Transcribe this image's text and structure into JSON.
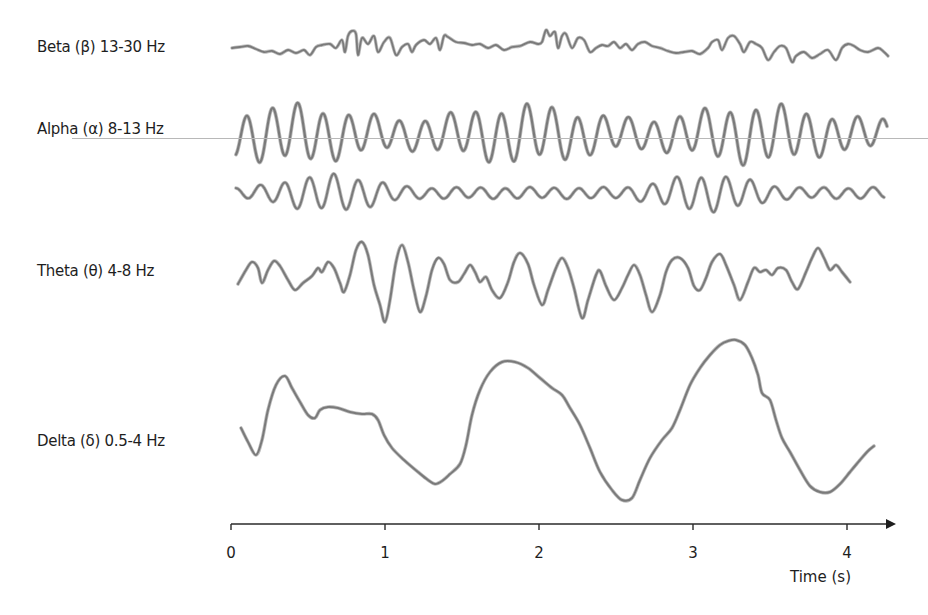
{
  "chart_data": {
    "type": "line",
    "title": "",
    "xlabel": "Time (s)",
    "ylabel": "",
    "xlim": [
      0,
      4.3
    ],
    "x_ticks": [
      "0",
      "1",
      "2",
      "3",
      "4"
    ],
    "grid": false,
    "legend": "none (row labels on left)",
    "stroke_color": "#7a7a7a",
    "series": [
      {
        "name": "Beta (β) 13-30 Hz",
        "band": "beta",
        "freq_range_hz": [
          13,
          30
        ],
        "baseline_y": 50,
        "amplitude_px": 12
      },
      {
        "name": "Alpha (α) 8-13 Hz",
        "band": "alpha",
        "freq_range_hz": [
          8,
          13
        ],
        "baseline_y": 135,
        "amplitude_px": 28
      },
      {
        "name": "Alpha (α) 8-13 Hz (second trace)",
        "band": "alpha-2",
        "freq_range_hz": [
          8,
          13
        ],
        "baseline_y": 193,
        "amplitude_px": 14
      },
      {
        "name": "Theta (θ) 4-8 Hz",
        "band": "theta",
        "freq_range_hz": [
          4,
          8
        ],
        "baseline_y": 275,
        "amplitude_px": 40
      },
      {
        "name": "Delta (δ) 0.5-4 Hz",
        "band": "delta",
        "freq_range_hz": [
          0.5,
          4
        ],
        "baseline_y": 420,
        "amplitude_px": 80
      }
    ]
  },
  "labels": {
    "beta": "Beta (β) 13-30 Hz",
    "alpha": "Alpha (α) 8-13 Hz",
    "theta": "Theta (θ) 4-8 Hz",
    "delta": "Delta (δ) 0.5-4 Hz"
  },
  "axis": {
    "title": "Time (s)",
    "ticks": [
      "0",
      "1",
      "2",
      "3",
      "4"
    ]
  },
  "waves": {
    "delta": [
      [
        241,
        428
      ],
      [
        248,
        442
      ],
      [
        256,
        455
      ],
      [
        262,
        440
      ],
      [
        268,
        410
      ],
      [
        276,
        385
      ],
      [
        285,
        376
      ],
      [
        292,
        388
      ],
      [
        300,
        402
      ],
      [
        308,
        415
      ],
      [
        315,
        418
      ],
      [
        320,
        410
      ],
      [
        328,
        407
      ],
      [
        338,
        408
      ],
      [
        350,
        412
      ],
      [
        362,
        414
      ],
      [
        372,
        414
      ],
      [
        378,
        420
      ],
      [
        384,
        435
      ],
      [
        392,
        448
      ],
      [
        404,
        460
      ],
      [
        418,
        472
      ],
      [
        428,
        480
      ],
      [
        435,
        484
      ],
      [
        442,
        481
      ],
      [
        450,
        474
      ],
      [
        460,
        464
      ],
      [
        466,
        445
      ],
      [
        472,
        415
      ],
      [
        480,
        390
      ],
      [
        490,
        372
      ],
      [
        502,
        362
      ],
      [
        515,
        362
      ],
      [
        528,
        368
      ],
      [
        540,
        378
      ],
      [
        552,
        388
      ],
      [
        562,
        395
      ],
      [
        570,
        408
      ],
      [
        580,
        425
      ],
      [
        590,
        448
      ],
      [
        600,
        472
      ],
      [
        612,
        490
      ],
      [
        622,
        500
      ],
      [
        632,
        498
      ],
      [
        640,
        480
      ],
      [
        650,
        458
      ],
      [
        662,
        440
      ],
      [
        672,
        428
      ],
      [
        680,
        410
      ],
      [
        690,
        385
      ],
      [
        700,
        368
      ],
      [
        710,
        355
      ],
      [
        720,
        345
      ],
      [
        728,
        341
      ],
      [
        736,
        340
      ],
      [
        745,
        345
      ],
      [
        752,
        358
      ],
      [
        758,
        375
      ],
      [
        762,
        393
      ],
      [
        770,
        400
      ],
      [
        776,
        420
      ],
      [
        782,
        438
      ],
      [
        790,
        452
      ],
      [
        800,
        470
      ],
      [
        810,
        486
      ],
      [
        820,
        492
      ],
      [
        830,
        492
      ],
      [
        840,
        484
      ],
      [
        850,
        472
      ],
      [
        860,
        460
      ],
      [
        868,
        451
      ],
      [
        874,
        446
      ]
    ],
    "theta": [
      [
        238,
        284
      ],
      [
        246,
        270
      ],
      [
        252,
        262
      ],
      [
        258,
        268
      ],
      [
        262,
        283
      ],
      [
        268,
        270
      ],
      [
        274,
        261
      ],
      [
        280,
        266
      ],
      [
        288,
        280
      ],
      [
        295,
        290
      ],
      [
        303,
        283
      ],
      [
        312,
        276
      ],
      [
        318,
        268
      ],
      [
        322,
        272
      ],
      [
        328,
        262
      ],
      [
        334,
        268
      ],
      [
        340,
        283
      ],
      [
        344,
        292
      ],
      [
        350,
        275
      ],
      [
        356,
        250
      ],
      [
        362,
        242
      ],
      [
        368,
        255
      ],
      [
        374,
        285
      ],
      [
        380,
        305
      ],
      [
        385,
        322
      ],
      [
        390,
        300
      ],
      [
        396,
        262
      ],
      [
        402,
        245
      ],
      [
        408,
        262
      ],
      [
        414,
        290
      ],
      [
        420,
        312
      ],
      [
        426,
        296
      ],
      [
        432,
        270
      ],
      [
        438,
        258
      ],
      [
        444,
        264
      ],
      [
        450,
        280
      ],
      [
        458,
        282
      ],
      [
        464,
        274
      ],
      [
        470,
        265
      ],
      [
        475,
        272
      ],
      [
        480,
        282
      ],
      [
        486,
        277
      ],
      [
        492,
        290
      ],
      [
        500,
        298
      ],
      [
        508,
        282
      ],
      [
        514,
        262
      ],
      [
        520,
        253
      ],
      [
        528,
        264
      ],
      [
        534,
        285
      ],
      [
        542,
        305
      ],
      [
        548,
        290
      ],
      [
        556,
        268
      ],
      [
        562,
        258
      ],
      [
        568,
        268
      ],
      [
        574,
        288
      ],
      [
        582,
        318
      ],
      [
        588,
        300
      ],
      [
        596,
        275
      ],
      [
        600,
        271
      ],
      [
        606,
        286
      ],
      [
        614,
        300
      ],
      [
        622,
        288
      ],
      [
        628,
        275
      ],
      [
        634,
        265
      ],
      [
        640,
        275
      ],
      [
        646,
        295
      ],
      [
        652,
        312
      ],
      [
        660,
        295
      ],
      [
        666,
        272
      ],
      [
        672,
        260
      ],
      [
        680,
        258
      ],
      [
        688,
        268
      ],
      [
        694,
        286
      ],
      [
        700,
        290
      ],
      [
        706,
        278
      ],
      [
        712,
        262
      ],
      [
        720,
        254
      ],
      [
        726,
        265
      ],
      [
        734,
        285
      ],
      [
        740,
        300
      ],
      [
        748,
        282
      ],
      [
        754,
        268
      ],
      [
        760,
        272
      ],
      [
        766,
        270
      ],
      [
        772,
        275
      ],
      [
        778,
        268
      ],
      [
        786,
        270
      ],
      [
        792,
        282
      ],
      [
        798,
        289
      ],
      [
        806,
        272
      ],
      [
        812,
        258
      ],
      [
        818,
        248
      ],
      [
        824,
        258
      ],
      [
        830,
        270
      ],
      [
        836,
        265
      ],
      [
        842,
        272
      ],
      [
        850,
        282
      ]
    ],
    "beta": [
      [
        232,
        48
      ],
      [
        240,
        47
      ],
      [
        248,
        46
      ],
      [
        256,
        49
      ],
      [
        264,
        52
      ],
      [
        272,
        51
      ],
      [
        280,
        54
      ],
      [
        288,
        50
      ],
      [
        296,
        53
      ],
      [
        304,
        50
      ],
      [
        310,
        55
      ],
      [
        316,
        47
      ],
      [
        322,
        45
      ],
      [
        330,
        44
      ],
      [
        336,
        48
      ],
      [
        342,
        40
      ],
      [
        345,
        52
      ],
      [
        348,
        36
      ],
      [
        352,
        31
      ],
      [
        356,
        34
      ],
      [
        358,
        55
      ],
      [
        362,
        38
      ],
      [
        368,
        44
      ],
      [
        374,
        36
      ],
      [
        378,
        52
      ],
      [
        384,
        42
      ],
      [
        390,
        38
      ],
      [
        396,
        55
      ],
      [
        402,
        47
      ],
      [
        408,
        44
      ],
      [
        412,
        52
      ],
      [
        416,
        45
      ],
      [
        424,
        40
      ],
      [
        430,
        44
      ],
      [
        436,
        38
      ],
      [
        440,
        50
      ],
      [
        444,
        36
      ],
      [
        448,
        37
      ],
      [
        456,
        42
      ],
      [
        464,
        43
      ],
      [
        472,
        45
      ],
      [
        480,
        44
      ],
      [
        488,
        48
      ],
      [
        496,
        45
      ],
      [
        504,
        50
      ],
      [
        512,
        47
      ],
      [
        520,
        46
      ],
      [
        530,
        42
      ],
      [
        538,
        44
      ],
      [
        542,
        42
      ],
      [
        546,
        30
      ],
      [
        550,
        36
      ],
      [
        555,
        32
      ],
      [
        558,
        48
      ],
      [
        562,
        36
      ],
      [
        566,
        34
      ],
      [
        572,
        48
      ],
      [
        578,
        38
      ],
      [
        584,
        40
      ],
      [
        590,
        52
      ],
      [
        596,
        48
      ],
      [
        602,
        45
      ],
      [
        608,
        46
      ],
      [
        614,
        42
      ],
      [
        620,
        48
      ],
      [
        626,
        44
      ],
      [
        632,
        50
      ],
      [
        638,
        44
      ],
      [
        645,
        42
      ],
      [
        652,
        46
      ],
      [
        660,
        48
      ],
      [
        668,
        51
      ],
      [
        676,
        53
      ],
      [
        684,
        52
      ],
      [
        692,
        51
      ],
      [
        700,
        54
      ],
      [
        708,
        48
      ],
      [
        712,
        42
      ],
      [
        718,
        40
      ],
      [
        722,
        50
      ],
      [
        728,
        38
      ],
      [
        734,
        36
      ],
      [
        740,
        44
      ],
      [
        744,
        52
      ],
      [
        750,
        42
      ],
      [
        756,
        44
      ],
      [
        762,
        48
      ],
      [
        768,
        60
      ],
      [
        774,
        52
      ],
      [
        780,
        46
      ],
      [
        786,
        48
      ],
      [
        792,
        62
      ],
      [
        796,
        56
      ],
      [
        804,
        52
      ],
      [
        812,
        58
      ],
      [
        820,
        54
      ],
      [
        828,
        50
      ],
      [
        836,
        60
      ],
      [
        842,
        48
      ],
      [
        848,
        44
      ],
      [
        854,
        46
      ],
      [
        860,
        50
      ],
      [
        868,
        52
      ],
      [
        878,
        48
      ],
      [
        884,
        52
      ],
      [
        888,
        56
      ]
    ]
  }
}
